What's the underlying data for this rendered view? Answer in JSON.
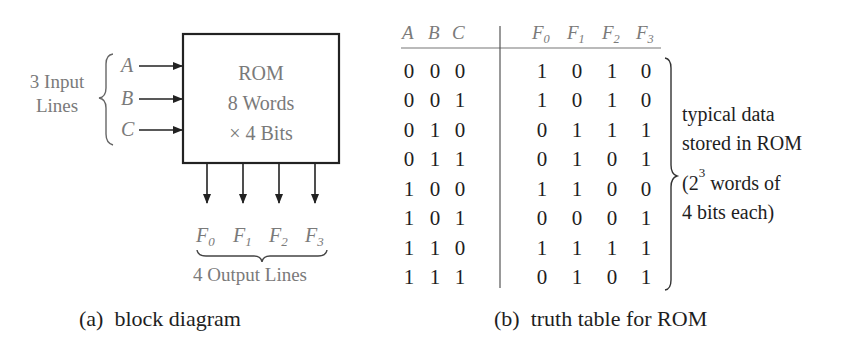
{
  "block_diagram": {
    "box_lines": [
      "ROM",
      "8 Words",
      "× 4 Bits"
    ],
    "input_group_label_lines": [
      "3 Input",
      "Lines"
    ],
    "inputs": [
      "A",
      "B",
      "C"
    ],
    "outputs": [
      {
        "base": "F",
        "sub": "0"
      },
      {
        "base": "F",
        "sub": "1"
      },
      {
        "base": "F",
        "sub": "2"
      },
      {
        "base": "F",
        "sub": "3"
      }
    ],
    "output_group_label": "4 Output Lines",
    "caption": "(a)  block diagram"
  },
  "truth_table": {
    "input_headers": [
      "A",
      "B",
      "C"
    ],
    "output_headers": [
      {
        "base": "F",
        "sub": "0"
      },
      {
        "base": "F",
        "sub": "1"
      },
      {
        "base": "F",
        "sub": "2"
      },
      {
        "base": "F",
        "sub": "3"
      }
    ],
    "rows": [
      {
        "in": [
          "0",
          "0",
          "0"
        ],
        "out": [
          "1",
          "0",
          "1",
          "0"
        ]
      },
      {
        "in": [
          "0",
          "0",
          "1"
        ],
        "out": [
          "1",
          "0",
          "1",
          "0"
        ]
      },
      {
        "in": [
          "0",
          "1",
          "0"
        ],
        "out": [
          "0",
          "1",
          "1",
          "1"
        ]
      },
      {
        "in": [
          "0",
          "1",
          "1"
        ],
        "out": [
          "0",
          "1",
          "0",
          "1"
        ]
      },
      {
        "in": [
          "1",
          "0",
          "0"
        ],
        "out": [
          "1",
          "1",
          "0",
          "0"
        ]
      },
      {
        "in": [
          "1",
          "0",
          "1"
        ],
        "out": [
          "0",
          "0",
          "0",
          "1"
        ]
      },
      {
        "in": [
          "1",
          "1",
          "0"
        ],
        "out": [
          "1",
          "1",
          "1",
          "1"
        ]
      },
      {
        "in": [
          "1",
          "1",
          "1"
        ],
        "out": [
          "0",
          "1",
          "0",
          "1"
        ]
      }
    ],
    "annotation_lines": [
      "typical data",
      "stored in ROM",
      "(2",
      "3",
      " words of",
      "4 bits each)"
    ],
    "caption": "(b)  truth table for ROM"
  }
}
